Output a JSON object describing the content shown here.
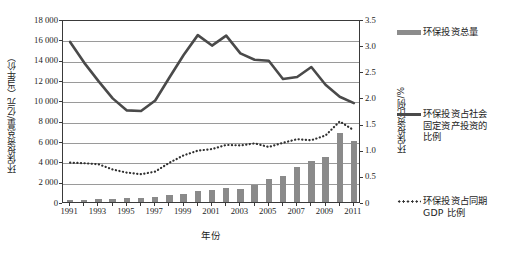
{
  "chart_data": {
    "type": "bar",
    "title": "",
    "xlabel": "年份",
    "ylabel": "环保投资总量/亿元（当年价）",
    "y2label": "环保投资比例/%",
    "ylim": [
      0,
      18000
    ],
    "y2lim": [
      0,
      3.5
    ],
    "grid": true,
    "legend_position": "right",
    "categories": [
      "1991",
      "1992",
      "1993",
      "1994",
      "1995",
      "1996",
      "1997",
      "1998",
      "1999",
      "2000",
      "2001",
      "2002",
      "2003",
      "2004",
      "2005",
      "2006",
      "2007",
      "2008",
      "2009",
      "2010",
      "2011"
    ],
    "xtick_labels": [
      "1991",
      "1993",
      "1995",
      "1997",
      "1999",
      "2001",
      "2003",
      "2005",
      "2007",
      "2009",
      "2011"
    ],
    "ytick_labels": [
      "0",
      "2 000",
      "4 000",
      "6 000",
      "8 000",
      "10 000",
      "12 000",
      "14 000",
      "16 000",
      "18 000"
    ],
    "y2tick_labels": [
      "0",
      "0.5",
      "1.0",
      "1.5",
      "2.0",
      "2.5",
      "3.0",
      "3.5"
    ],
    "series": [
      {
        "name": "环保投资总量",
        "kind": "bar",
        "axis": "left",
        "units": "亿元",
        "color": "#8a8a8a",
        "values": [
          170,
          205,
          270,
          310,
          350,
          410,
          450,
          720,
          820,
          1060,
          1160,
          1360,
          1320,
          1680,
          2220,
          2560,
          3490,
          4060,
          4450,
          6750,
          6030
        ]
      },
      {
        "name": "环保投资占社会固定资产投资的比例",
        "kind": "line",
        "axis": "right",
        "units": "%",
        "color": "#4a4a4a",
        "values": [
          3.1,
          2.7,
          2.35,
          2.02,
          1.79,
          1.78,
          1.98,
          2.42,
          2.85,
          3.23,
          3.03,
          3.22,
          2.88,
          2.76,
          2.74,
          2.39,
          2.43,
          2.62,
          2.28,
          2.05,
          1.93
        ]
      },
      {
        "name": "环保投资占同期GDP比例",
        "kind": "dotted-line",
        "axis": "right",
        "units": "%",
        "color": "#303030",
        "values": [
          0.79,
          0.78,
          0.76,
          0.66,
          0.6,
          0.57,
          0.62,
          0.79,
          0.93,
          1.02,
          1.05,
          1.13,
          1.12,
          1.16,
          1.09,
          1.17,
          1.24,
          1.22,
          1.31,
          1.58,
          1.41
        ]
      }
    ]
  },
  "legend": {
    "items": [
      {
        "label": "环保投资总量",
        "marker": "bar-swatch"
      },
      {
        "label": "环保投资占社会\n固定资产投资的\n比例",
        "marker": "solid-line"
      },
      {
        "label": "环保投资占同期\nGDP 比例",
        "marker": "dotted-line"
      }
    ]
  },
  "axes": {
    "left_title": "环保投资总量/亿元（当年价）",
    "right_title": "环保投资比例/%",
    "x_title": "年份"
  },
  "caption": ""
}
